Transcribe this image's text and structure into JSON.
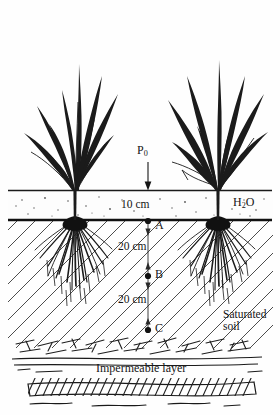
{
  "figure": {
    "labels": {
      "applied_head": "P",
      "applied_head_sub": "0",
      "ponded_depth": "10 cm",
      "water": "H",
      "water_sub": "2",
      "water_suffix": "O",
      "point_a": "A",
      "point_b": "B",
      "point_c": "C",
      "spacing_ab": "20 cm",
      "spacing_bc": "20 cm",
      "saturated_line1": "Saturated",
      "saturated_line2": "soil",
      "impermeable": "Impermeable layer"
    },
    "colors": {
      "ink": "#151515",
      "background": "#ffffff",
      "hatch": "#4a4a4a",
      "speckle": "#5a5a5a"
    },
    "geometry": {
      "width": 280,
      "height": 415,
      "water_surface_y": 190,
      "soil_surface_y": 220,
      "point_a_y": 221,
      "point_b_y": 276,
      "point_c_y": 330,
      "measure_line_x": 148,
      "rock_layer_y": 348,
      "impermeable_band_y": 384,
      "left_plant_x": 75,
      "right_plant_x": 218
    }
  }
}
